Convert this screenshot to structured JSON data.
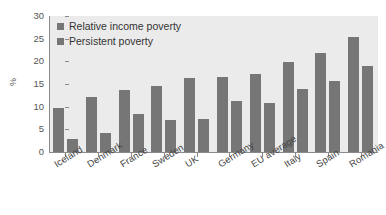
{
  "chart_data": {
    "type": "bar",
    "title": "",
    "subtitle": "",
    "xlabel": "",
    "ylabel": "%",
    "ylim": [
      0,
      30
    ],
    "yticks": [
      0,
      5,
      10,
      15,
      20,
      25,
      30
    ],
    "ytick_labels": [
      "0",
      "5",
      "10",
      "15",
      "20",
      "25",
      "30"
    ],
    "grid": false,
    "legend_position": "top-left",
    "categories": [
      "Iceland",
      "Denmark",
      "France",
      "Sweden",
      "UK",
      "Germany",
      "EU average",
      "Italy",
      "Spain",
      "Romania"
    ],
    "series": [
      {
        "name": "Relative income poverty",
        "color": "#767676",
        "values": [
          9.7,
          12.2,
          13.6,
          14.5,
          16.4,
          16.5,
          17.3,
          19.8,
          21.9,
          25.3
        ]
      },
      {
        "name": "Persistent poverty",
        "color": "#767676",
        "values": [
          2.9,
          4.3,
          8.3,
          7.1,
          7.2,
          11.2,
          10.8,
          14.0,
          15.6,
          18.9
        ]
      }
    ],
    "annotations": []
  },
  "legend": {
    "items": [
      {
        "label": "Relative income poverty",
        "swatch_icon": "square-swatch-icon"
      },
      {
        "label": "Persistent poverty",
        "swatch_icon": "square-swatch-icon"
      }
    ]
  },
  "colors": {
    "bar": "#767676",
    "plot_background": "#ebebeb",
    "page_background": "#ffffff",
    "axis": "#8a8a8a",
    "text": "#444444"
  }
}
